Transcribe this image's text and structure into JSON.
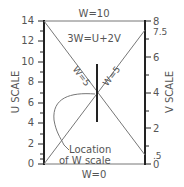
{
  "diagram": {
    "type": "nomogram",
    "equation": "3W=U+2V",
    "top_label": "W=10",
    "bottom_label": "W=0",
    "left_axis": {
      "title": "U SCALE",
      "min": 0,
      "max": 14,
      "tick_labels": [
        "0",
        "2",
        "4",
        "6",
        "8",
        "10",
        "12",
        "14"
      ]
    },
    "right_axis": {
      "title": "V SCALE",
      "min": 0,
      "max": 8,
      "tick_labels": [
        "0",
        ".5",
        "2",
        "4",
        "6",
        "7.5",
        "8"
      ]
    },
    "diagonal_left_label": "W=5",
    "diagonal_right_label": "W=5",
    "annotation_line1": "Location",
    "annotation_line2": "of W scale"
  },
  "colors": {
    "axis": "#222222",
    "line": "#777777",
    "text": "#555555",
    "background": "#ffffff"
  }
}
